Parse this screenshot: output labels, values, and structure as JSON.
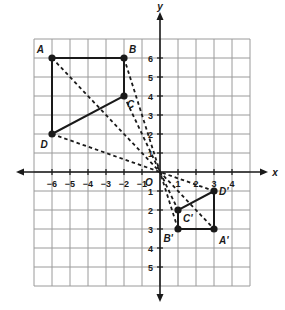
{
  "diagram": {
    "type": "coordinate-plane-dilation",
    "axes": {
      "x_label": "x",
      "y_label": "y",
      "origin_label": "O",
      "x_range": [
        -7,
        5
      ],
      "y_range": [
        -6,
        7
      ],
      "x_ticks": [
        {
          "value": -6,
          "label": "−6"
        },
        {
          "value": -5,
          "label": "−5"
        },
        {
          "value": -4,
          "label": "−4"
        },
        {
          "value": -3,
          "label": "−3"
        },
        {
          "value": -2,
          "label": "−2"
        },
        {
          "value": -1,
          "label": "−1"
        },
        {
          "value": 1,
          "label": "1"
        },
        {
          "value": 2,
          "label": "2"
        },
        {
          "value": 3,
          "label": "3"
        },
        {
          "value": 4,
          "label": "4"
        }
      ],
      "y_ticks": [
        {
          "value": 6,
          "label": "6"
        },
        {
          "value": 5,
          "label": "5"
        },
        {
          "value": 4,
          "label": "4"
        },
        {
          "value": 3,
          "label": "3"
        },
        {
          "value": 2,
          "label": "2"
        },
        {
          "value": 1,
          "label": "1"
        },
        {
          "value": -1,
          "label": "1"
        },
        {
          "value": -2,
          "label": "2"
        },
        {
          "value": -3,
          "label": "3"
        },
        {
          "value": -4,
          "label": "4"
        },
        {
          "value": -5,
          "label": "5"
        }
      ]
    },
    "original_figure": {
      "name": "ABCD",
      "vertices": [
        {
          "label": "A",
          "x": -6,
          "y": 6
        },
        {
          "label": "B",
          "x": -2,
          "y": 6
        },
        {
          "label": "C",
          "x": -2,
          "y": 4
        },
        {
          "label": "D",
          "x": -6,
          "y": 2
        }
      ]
    },
    "image_figure": {
      "name": "A'B'C'D'",
      "vertices": [
        {
          "label": "A'",
          "x": 3,
          "y": -3
        },
        {
          "label": "B'",
          "x": 1,
          "y": -3
        },
        {
          "label": "C'",
          "x": 1,
          "y": -2
        },
        {
          "label": "D'",
          "x": 3,
          "y": -1
        }
      ]
    },
    "dashed_rays": [
      {
        "from": "A",
        "to": "A'"
      },
      {
        "from": "B",
        "to": "B'"
      },
      {
        "from": "C",
        "to": "C'"
      },
      {
        "from": "D",
        "to": "D'"
      }
    ],
    "colors": {
      "grid": "#9a9a9a",
      "axis": "#1a1a1a",
      "figure": "#1a1a1a",
      "background": "#ffffff"
    }
  }
}
